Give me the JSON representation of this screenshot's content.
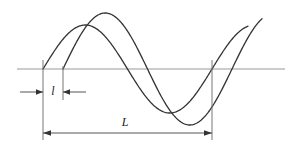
{
  "figure": {
    "title": "",
    "type": "line-diagram",
    "background_color": "#ffffff",
    "stroke_color": "#333333",
    "axis_color": "#999999",
    "dimension_color": "#555555",
    "labels": {
      "small_l": "l",
      "large_l": "L"
    },
    "label_meanings": {
      "small_l": "phase-offset-between-waves",
      "large_l": "wavelength"
    }
  },
  "chart_data": {
    "type": "line",
    "title": "",
    "xlabel": "",
    "ylabel": "",
    "grid": false,
    "legend": null,
    "xlim": [
      17,
      285
    ],
    "ylim": [
      0,
      150
    ],
    "baseline_y": 69,
    "annotations": [
      {
        "name": "l",
        "text": "l",
        "kind": "dimension",
        "from_x": 43,
        "to_x": 63,
        "value": 20,
        "y": 92,
        "label_x": 53,
        "label_y": 95,
        "arrow_style": "outward"
      },
      {
        "name": "L",
        "text": "L",
        "kind": "dimension",
        "from_x": 43,
        "to_x": 212,
        "value": 169,
        "y": 133,
        "label_x": 125,
        "label_y": 126,
        "arrow_style": "inward"
      }
    ],
    "extension_lines": [
      {
        "x": 43,
        "y1": 60,
        "y2": 140
      },
      {
        "x": 63,
        "y1": 66,
        "y2": 100
      },
      {
        "x": 212,
        "y1": 60,
        "y2": 140
      }
    ],
    "series": [
      {
        "name": "wave-1",
        "phase_x0": 43,
        "wavelength": 169,
        "amplitude": 44,
        "x_end": 248,
        "color": "#333333"
      },
      {
        "name": "wave-2",
        "phase_x0": 63,
        "wavelength": 169,
        "amplitude": 56,
        "x_end": 262,
        "color": "#333333"
      }
    ]
  }
}
